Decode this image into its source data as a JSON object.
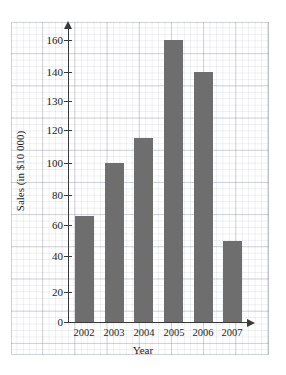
{
  "chart_data": {
    "type": "bar",
    "title": "",
    "xlabel": "Year",
    "ylabel": "Sales (in $10 000)",
    "categories": [
      "2002",
      "2003",
      "2004",
      "2005",
      "2006",
      "2007"
    ],
    "values": [
      66,
      100,
      115,
      160,
      140,
      50
    ],
    "series": [
      {
        "name": "Sales",
        "values": [
          66,
          100,
          115,
          160,
          140,
          50
        ]
      }
    ],
    "ytick_labels": [
      "0",
      "20",
      "40",
      "60",
      "80",
      "100",
      "120",
      "130",
      "140",
      "160"
    ],
    "ytick_values": [
      0,
      20,
      40,
      60,
      80,
      100,
      120,
      130,
      140,
      160
    ],
    "ylim": [
      0,
      170
    ],
    "grid": true,
    "grid_style": "graph-paper",
    "legend": "none",
    "bar_color": "#6e6e6e",
    "axis_color": "#3a3a3a",
    "grid_color": "#8692a6",
    "background_color": "#ffffff",
    "axis_arrows": true
  },
  "axes": {
    "y_title": "Sales (in $10 000)",
    "x_title": "Year"
  }
}
